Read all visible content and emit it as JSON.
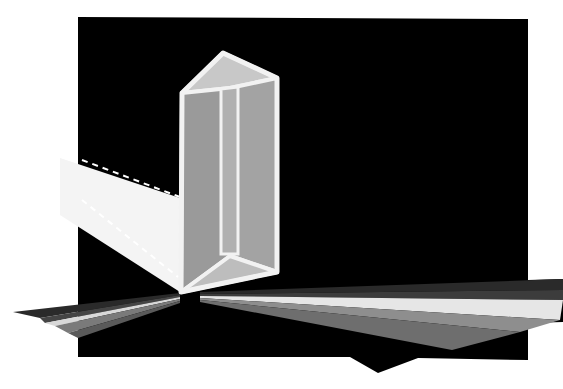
{
  "image": {
    "description": "Illustration of a triangular glass prism dispersing a white light beam into a spectrum of grey bands on a black background",
    "colors": {
      "page_background": "#ffffff",
      "backdrop": "#000000",
      "prism_frame": "#f2f2f2",
      "prism_face_left": "#9a9a9a",
      "prism_face_right": "#a3a3a3",
      "prism_top": "#c8c8c8",
      "prism_bottom": "#bdbdbd",
      "beam": "#f4f4f4",
      "beam_edge_dashes": "#ffffff"
    },
    "spectrum_bands_right": [
      {
        "name": "band-1",
        "color": "#2a2a2a"
      },
      {
        "name": "band-2",
        "color": "#3c3c3c"
      },
      {
        "name": "band-3",
        "color": "#e6e6e6"
      },
      {
        "name": "band-4",
        "color": "#8e8e8e"
      },
      {
        "name": "band-5",
        "color": "#6e6e6e"
      },
      {
        "name": "band-6",
        "color": "#555555"
      }
    ],
    "spectrum_bands_left": [
      {
        "name": "band-1",
        "color": "#2a2a2a"
      },
      {
        "name": "band-2",
        "color": "#454545"
      },
      {
        "name": "band-3",
        "color": "#d8d8d8"
      },
      {
        "name": "band-4",
        "color": "#7a7a7a"
      },
      {
        "name": "band-5",
        "color": "#5a5a5a"
      }
    ]
  }
}
